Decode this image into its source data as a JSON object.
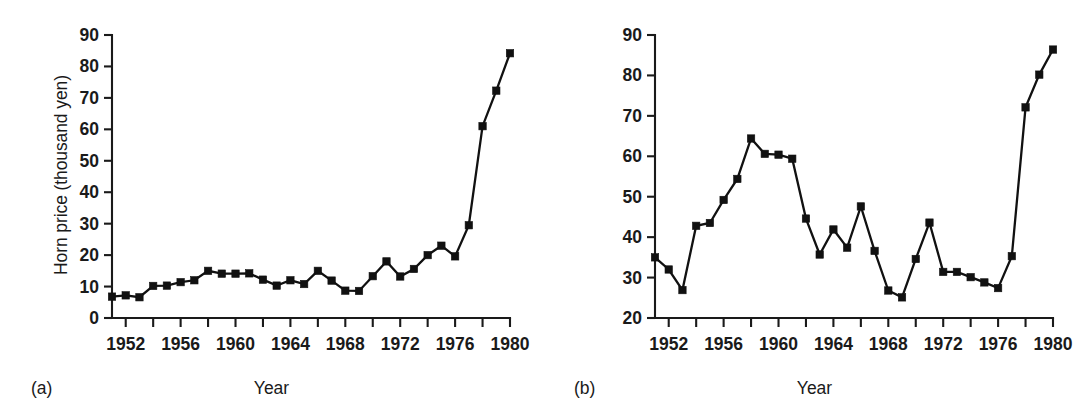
{
  "figure": {
    "background": "#ffffff",
    "ink_color": "#111111"
  },
  "panels": [
    {
      "caption": "(a)",
      "ylabel": "Horn price (thousand yen)",
      "xlabel": "Year"
    },
    {
      "caption": "(b)",
      "ylabel": "Real horn price (thousand yen)",
      "xlabel": "Year"
    }
  ],
  "chart_data": [
    {
      "type": "line",
      "title": "",
      "panel": "(a)",
      "xlabel": "Year",
      "ylabel": "Horn price (thousand yen)",
      "xlim": [
        1951,
        1980
      ],
      "ylim": [
        0,
        90
      ],
      "xticks": [
        1952,
        1954,
        1956,
        1958,
        1960,
        1962,
        1964,
        1966,
        1968,
        1970,
        1972,
        1974,
        1976,
        1978,
        1980
      ],
      "xticklabels": [
        "1952",
        "",
        "1956",
        "",
        "1960",
        "",
        "1964",
        "",
        "1968",
        "",
        "1972",
        "",
        "1976",
        "",
        "1980"
      ],
      "xticklabels_shown": [
        "1952",
        "1956",
        "1960",
        "1964",
        "1968",
        "1972",
        "1976",
        "1980"
      ],
      "yticks": [
        0,
        10,
        20,
        30,
        40,
        50,
        60,
        70,
        80,
        90
      ],
      "yticklabels": [
        "0",
        "10",
        "20",
        "30",
        "40",
        "50",
        "60",
        "70",
        "80",
        "90"
      ],
      "grid": false,
      "legend": false,
      "marker": "square",
      "x": [
        1951,
        1952,
        1953,
        1954,
        1955,
        1956,
        1957,
        1958,
        1959,
        1960,
        1961,
        1962,
        1963,
        1964,
        1965,
        1966,
        1967,
        1968,
        1969,
        1970,
        1971,
        1972,
        1973,
        1974,
        1975,
        1976,
        1977,
        1978,
        1979,
        1980
      ],
      "values": [
        6.8,
        7.2,
        6.6,
        10.2,
        10.3,
        11.4,
        12.0,
        15.0,
        14.1,
        14.1,
        14.2,
        12.2,
        10.3,
        12.0,
        10.8,
        15.0,
        11.9,
        8.7,
        8.6,
        13.3,
        18.0,
        13.2,
        15.6,
        20.0,
        23.0,
        19.6,
        29.5,
        61.0,
        72.3,
        84.2
      ]
    },
    {
      "type": "line",
      "title": "",
      "panel": "(b)",
      "xlabel": "Year",
      "ylabel": "Real horn price (thousand yen)",
      "xlim": [
        1951,
        1980
      ],
      "ylim": [
        20,
        90
      ],
      "xticks": [
        1952,
        1954,
        1956,
        1958,
        1960,
        1962,
        1964,
        1966,
        1968,
        1970,
        1972,
        1974,
        1976,
        1978,
        1980
      ],
      "xticklabels_shown": [
        "1952",
        "1956",
        "1960",
        "1964",
        "1968",
        "1972",
        "1976",
        "1980"
      ],
      "yticks": [
        20,
        30,
        40,
        50,
        60,
        70,
        80,
        90
      ],
      "yticklabels": [
        "20",
        "30",
        "40",
        "50",
        "60",
        "70",
        "80",
        "90"
      ],
      "grid": false,
      "legend": false,
      "marker": "square",
      "x": [
        1951,
        1952,
        1953,
        1954,
        1955,
        1956,
        1957,
        1958,
        1959,
        1960,
        1961,
        1962,
        1963,
        1964,
        1965,
        1966,
        1967,
        1968,
        1969,
        1970,
        1971,
        1972,
        1973,
        1974,
        1975,
        1976,
        1977,
        1978,
        1979,
        1980
      ],
      "values": [
        35.0,
        32.0,
        26.9,
        42.8,
        43.5,
        49.2,
        54.4,
        64.4,
        60.6,
        60.4,
        59.4,
        44.6,
        35.7,
        41.9,
        37.4,
        47.6,
        36.6,
        26.8,
        25.1,
        34.6,
        43.6,
        31.4,
        31.4,
        30.1,
        28.8,
        27.4,
        35.3,
        72.1,
        80.2,
        86.4
      ]
    }
  ]
}
